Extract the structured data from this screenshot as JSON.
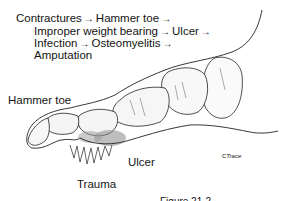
{
  "diagram": {
    "title_lines": [
      {
        "parts": [
          "Contractures",
          "Hammer toe",
          ""
        ]
      },
      {
        "parts": [
          "Improper weight bearing",
          "Ulcer",
          ""
        ]
      },
      {
        "parts": [
          "Infection",
          "Osteomyelitis",
          ""
        ]
      },
      {
        "parts": [
          "Amputation"
        ]
      }
    ],
    "arrow_glyph": "→",
    "labels": {
      "hammer_toe": "Hammer toe",
      "ulcer": "Ulcer",
      "trauma": "Trauma",
      "signature": "CTrace"
    },
    "caption_partial": "Figure 21-2"
  }
}
